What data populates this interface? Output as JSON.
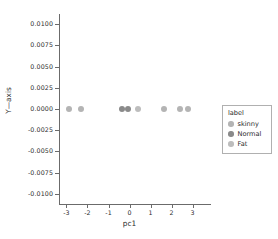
{
  "chart_data": {
    "type": "scatter",
    "title": "",
    "xlabel": "pc1",
    "ylabel": "Y—axis",
    "xlim": [
      -3.35,
      3.35
    ],
    "ylim": [
      -0.0112,
      0.0112
    ],
    "grid": false,
    "xticks": [
      "-3",
      "-2",
      "-1",
      "0",
      "1",
      "2",
      "3"
    ],
    "xtick_values": [
      -3,
      -2,
      -1,
      0,
      1,
      2,
      3
    ],
    "yticks": [
      "0.0100",
      "0.0075",
      "0.0050",
      "0.0025",
      "0.0000",
      "-0.0025",
      "-0.0050",
      "-0.0075",
      "-0.0100"
    ],
    "ytick_values": [
      0.01,
      0.0075,
      0.005,
      0.0025,
      0.0,
      -0.0025,
      -0.005,
      -0.0075,
      -0.01
    ],
    "legend": {
      "title": "label",
      "position": "center right outside",
      "entries": [
        {
          "label": "skinny",
          "color": "#b4b4b4"
        },
        {
          "label": "Normal",
          "color": "#8a8a8a"
        },
        {
          "label": "Fat",
          "color": "#bdbdbd"
        }
      ]
    },
    "series": [
      {
        "name": "skinny",
        "color": "#b4b4b4",
        "points": [
          {
            "x": -2.9,
            "y": 0.0
          },
          {
            "x": -2.32,
            "y": 0.0
          },
          {
            "x": 1.62,
            "y": 0.0
          },
          {
            "x": 2.42,
            "y": 0.0
          },
          {
            "x": 2.76,
            "y": 0.0
          }
        ]
      },
      {
        "name": "Normal",
        "color": "#8a8a8a",
        "points": [
          {
            "x": -0.34,
            "y": 0.0
          },
          {
            "x": -0.08,
            "y": 0.0
          }
        ]
      },
      {
        "name": "Fat",
        "color": "#bdbdbd",
        "points": [
          {
            "x": 0.38,
            "y": 0.0
          }
        ]
      }
    ]
  }
}
